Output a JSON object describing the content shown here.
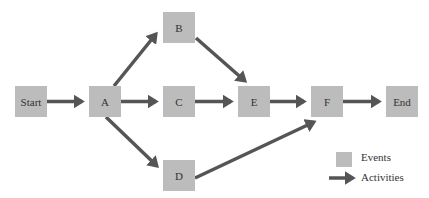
{
  "header": {
    "cut_off_text": ""
  },
  "nodes": [
    {
      "id": "start",
      "label": "Start"
    },
    {
      "id": "a",
      "label": "A"
    },
    {
      "id": "b",
      "label": "B"
    },
    {
      "id": "c",
      "label": "C"
    },
    {
      "id": "d",
      "label": "D"
    },
    {
      "id": "e",
      "label": "E"
    },
    {
      "id": "f",
      "label": "F"
    },
    {
      "id": "end",
      "label": "End"
    }
  ],
  "edges": [
    {
      "from": "Start",
      "to": "A"
    },
    {
      "from": "A",
      "to": "B"
    },
    {
      "from": "A",
      "to": "C"
    },
    {
      "from": "A",
      "to": "D"
    },
    {
      "from": "B",
      "to": "E"
    },
    {
      "from": "C",
      "to": "E"
    },
    {
      "from": "E",
      "to": "F"
    },
    {
      "from": "D",
      "to": "F"
    },
    {
      "from": "F",
      "to": "End"
    }
  ],
  "legend": {
    "events_label": "Events",
    "activities_label": "Activities"
  },
  "colors": {
    "node_fill": "#bcbcbc",
    "arrow": "#555555",
    "text": "#333333"
  }
}
